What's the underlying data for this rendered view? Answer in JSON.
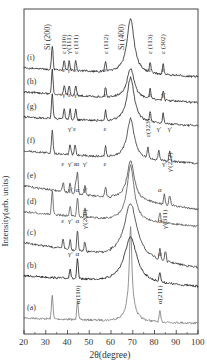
{
  "chart_data": {
    "type": "line",
    "title": "",
    "xlabel": "2θ(degree)",
    "ylabel": "Intensity(arb. units)",
    "xlim": [
      20,
      100
    ],
    "xticks": [
      20,
      30,
      40,
      50,
      60,
      70,
      80,
      90,
      100
    ],
    "grid": false,
    "legend": "none (curves labeled inline)",
    "reference_peaks": [
      {
        "label": "Si (200)",
        "x": 33
      },
      {
        "label": "Si (400)",
        "x": 69
      }
    ],
    "series": [
      {
        "name": "(a)",
        "color": "#777777",
        "peaks": [
          {
            "x": 33,
            "label": ""
          },
          {
            "x": 44.6,
            "label": "α(110)"
          },
          {
            "x": 69,
            "label": ""
          },
          {
            "x": 82.5,
            "label": "α(211)"
          }
        ]
      },
      {
        "name": "(b)",
        "color": "#111111",
        "peaks": [
          {
            "x": 41.2,
            "label": "γ'"
          },
          {
            "x": 44.6,
            "label": "α"
          },
          {
            "x": 69.5,
            "label": ""
          },
          {
            "x": 82.5,
            "label": "α"
          }
        ]
      },
      {
        "name": "(c)",
        "color": "#333333",
        "peaks": [
          {
            "x": 38,
            "label": "ε"
          },
          {
            "x": 41.2,
            "label": "γ'"
          },
          {
            "x": 44.6,
            "label": "α"
          },
          {
            "x": 48,
            "label": "γ'(200)"
          },
          {
            "x": 69,
            "label": ""
          },
          {
            "x": 82.5,
            "label": "α"
          },
          {
            "x": 85,
            "label": "γ'(311)"
          }
        ]
      },
      {
        "name": "(d)",
        "color": "#555555",
        "peaks": [
          {
            "x": 33,
            "label": ""
          },
          {
            "x": 41.2,
            "label": "γ'"
          },
          {
            "x": 44.6,
            "label": "α"
          },
          {
            "x": 48,
            "label": "γ'"
          },
          {
            "x": 69,
            "label": ""
          },
          {
            "x": 82.5,
            "label": "α"
          }
        ]
      },
      {
        "name": "(e)",
        "color": "#444444",
        "peaks": [
          {
            "x": 38,
            "label": "ε"
          },
          {
            "x": 41.2,
            "label": "γ'"
          },
          {
            "x": 43.8,
            "label": "ε"
          },
          {
            "x": 44.6,
            "label": "α"
          },
          {
            "x": 48,
            "label": "γ'"
          },
          {
            "x": 57.5,
            "label": "ε"
          },
          {
            "x": 69,
            "label": ""
          },
          {
            "x": 84.5,
            "label": "γ'"
          },
          {
            "x": 87,
            "label": "γ'(222)"
          }
        ]
      },
      {
        "name": "(f)",
        "color": "#333333",
        "peaks": [
          {
            "x": 33,
            "label": ""
          },
          {
            "x": 41.2,
            "label": "γ'"
          },
          {
            "x": 43.5,
            "label": "ε"
          },
          {
            "x": 57.5,
            "label": "ε"
          },
          {
            "x": 69,
            "label": ""
          },
          {
            "x": 77,
            "label": "ε(123)"
          },
          {
            "x": 82,
            "label": "γ'"
          },
          {
            "x": 87,
            "label": "γ'"
          }
        ]
      },
      {
        "name": "(g)",
        "color": "#222222",
        "peaks": [
          {
            "x": 33,
            "label": ""
          },
          {
            "x": 38.5,
            "label": "γ'"
          },
          {
            "x": 41.2,
            "label": "ε"
          },
          {
            "x": 43.8,
            "label": "γ'"
          },
          {
            "x": 57.5,
            "label": "ε"
          },
          {
            "x": 69,
            "label": ""
          },
          {
            "x": 78,
            "label": "ε"
          },
          {
            "x": 84,
            "label": "γ'"
          }
        ]
      },
      {
        "name": "(h)",
        "color": "#222222",
        "peaks": [
          {
            "x": 33,
            "label": ""
          },
          {
            "x": 38.5,
            "label": "ε"
          },
          {
            "x": 40.8,
            "label": "γ'"
          },
          {
            "x": 43.8,
            "label": "ε"
          },
          {
            "x": 57.5,
            "label": "ε"
          },
          {
            "x": 69,
            "label": ""
          },
          {
            "x": 78,
            "label": "ε"
          },
          {
            "x": 84,
            "label": "ε"
          }
        ]
      },
      {
        "name": "(i)",
        "color": "#222222",
        "peaks": [
          {
            "x": 33,
            "label": ""
          },
          {
            "x": 38.5,
            "label": "ε (110)"
          },
          {
            "x": 40.8,
            "label": "γ'(111)"
          },
          {
            "x": 43.8,
            "label": "ε (111)"
          },
          {
            "x": 57.5,
            "label": "ε (112)"
          },
          {
            "x": 69,
            "label": ""
          },
          {
            "x": 78,
            "label": "ε (113)"
          },
          {
            "x": 84,
            "label": "ε (302)"
          }
        ]
      }
    ]
  },
  "labels": {
    "ylabel": "Intensity(arb. units)",
    "xlabel": "2θ(degree)",
    "si200": "Si (200)",
    "si400": "Si (400)"
  }
}
